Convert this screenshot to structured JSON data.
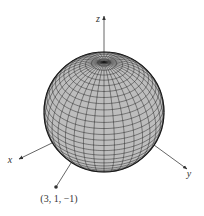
{
  "figure": {
    "type": "3d-sphere-wireframe",
    "sphere": {
      "center": [
        104,
        112
      ],
      "radius": 60,
      "tilt_deg": 56,
      "meridians": 36,
      "parallels": 30,
      "fill_color": "#bdbdbd",
      "line_color": "#1a1a1a"
    },
    "axes": {
      "z": {
        "label": "z",
        "from": [
          104,
          52
        ],
        "to": [
          104,
          16
        ],
        "label_pos": [
          98,
          22
        ]
      },
      "x": {
        "label": "x",
        "from": [
          52,
          143
        ],
        "to": [
          19,
          159
        ],
        "label_pos": [
          10,
          163
        ]
      },
      "y": {
        "label": "y",
        "from": [
          154,
          145
        ],
        "to": [
          187,
          169
        ],
        "label_pos": [
          189,
          177
        ]
      }
    },
    "point": {
      "label": "(3, 1, −1)",
      "position": [
        56,
        187
      ],
      "line_from": [
        71,
        163
      ],
      "label_pos": [
        59,
        202
      ]
    },
    "axis_color": "#555555"
  }
}
